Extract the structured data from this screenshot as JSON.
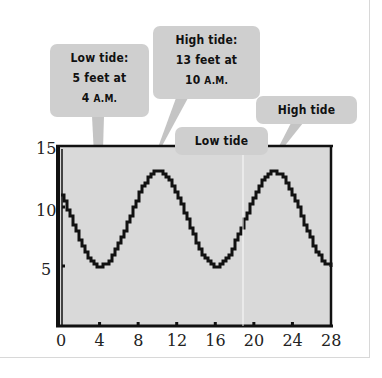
{
  "chart_data": {
    "type": "line",
    "title": "",
    "xlabel": "",
    "ylabel": "",
    "xlim": [
      0,
      28
    ],
    "ylim": [
      0,
      15
    ],
    "x_ticks": [
      0,
      4,
      8,
      12,
      16,
      20,
      24,
      28
    ],
    "y_ticks": [
      5,
      10,
      15
    ],
    "grid": false,
    "legend": null,
    "series": [
      {
        "name": "Tide height (feet)",
        "x": [
          0,
          1,
          2,
          3,
          4,
          5,
          6,
          7,
          8,
          9,
          10,
          11,
          12,
          13,
          14,
          15,
          16,
          17,
          18,
          19,
          20,
          21,
          22,
          23,
          24,
          25,
          26,
          27,
          28
        ],
        "values": [
          11,
          9,
          7,
          5.5,
          5,
          5.5,
          7,
          9,
          11,
          12.5,
          13,
          12.5,
          11,
          9,
          7,
          5.5,
          5,
          5.5,
          7,
          9,
          11,
          12.5,
          13,
          12.5,
          11,
          9,
          7,
          5.5,
          5
        ],
        "color": "#111111"
      }
    ],
    "annotations": [
      {
        "id": "low1",
        "lines": [
          "Low tide:",
          "5 feet at",
          "4 A.M."
        ],
        "point": [
          4,
          5
        ]
      },
      {
        "id": "high1",
        "lines": [
          "High tide:",
          "13 feet at",
          "10 A.M."
        ],
        "point": [
          10,
          13
        ]
      },
      {
        "id": "low2",
        "lines": [
          "Low tide"
        ],
        "point": [
          16,
          5
        ]
      },
      {
        "id": "high2",
        "lines": [
          "High tide"
        ],
        "point": [
          22,
          13
        ]
      }
    ]
  },
  "colors": {
    "plot_bg": "#d9d9d9",
    "frame": "#111111",
    "callout_bg": "#cfcfcf",
    "pointer": "#c4c4c4",
    "curve": "#111111"
  },
  "callouts": {
    "low1": {
      "line1": "Low tide:",
      "line2": "5 feet at",
      "line3_num": "4 ",
      "line3_unit": "A.M."
    },
    "high1": {
      "line1": "High tide:",
      "line2": "13 feet at",
      "line3_num": "10 ",
      "line3_unit": "A.M."
    },
    "low2": {
      "line1": "Low tide"
    },
    "high2": {
      "line1": "High tide"
    }
  },
  "axes": {
    "x_labels": [
      "0",
      "4",
      "8",
      "12",
      "16",
      "20",
      "24",
      "28"
    ],
    "y_labels": [
      "15",
      "10",
      "5"
    ]
  }
}
